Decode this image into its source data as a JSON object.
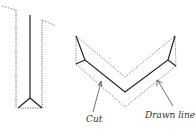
{
  "diagram": {
    "labels": {
      "cut": "Cut",
      "drawn_line": "Drawn line"
    },
    "colors": {
      "solid": "#222222",
      "dotted": "#555555",
      "text": "#333333"
    }
  }
}
